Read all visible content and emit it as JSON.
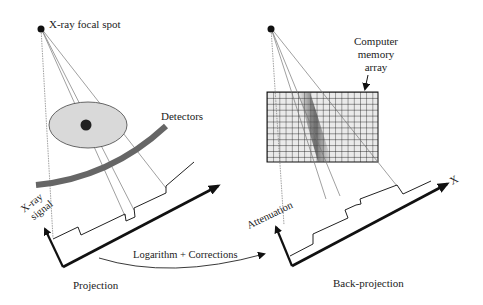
{
  "figure": {
    "left_panel": {
      "focal_spot_label": "X-ray focal spot",
      "detectors_label": "Detectors",
      "y_axis_label_line1": "X-ray",
      "y_axis_label_line2": "signal",
      "caption": "Projection"
    },
    "transform": {
      "label": "Logarithm + Corrections"
    },
    "right_panel": {
      "memory_label_line1": "Computer",
      "memory_label_line2": "memory",
      "memory_label_line3": "array",
      "y_axis_label": "Attenuation",
      "x_axis_label": "X",
      "caption": "Back-projection"
    },
    "colors": {
      "ink": "#111111",
      "detector": "#666666",
      "ellipse_fill": "#d9d9d9",
      "grid_fill": "#e6e6e6",
      "ray": "#777777"
    }
  }
}
